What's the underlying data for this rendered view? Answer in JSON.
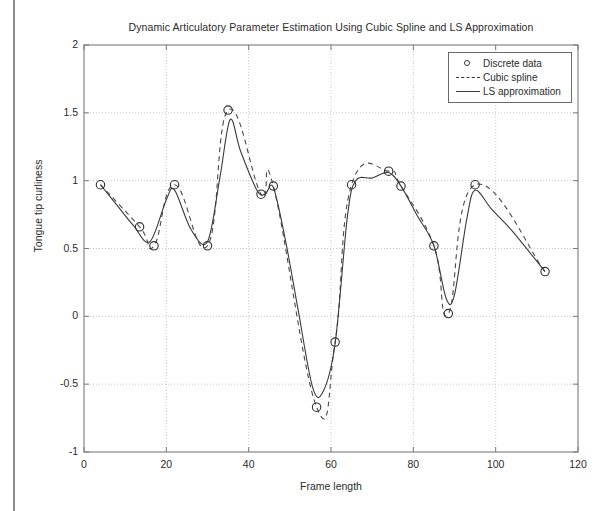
{
  "chart_data": {
    "type": "line",
    "title": "Dynamic Articulatory Parameter Estimation Using Cubic Spline and LS Approximation",
    "xlabel": "Frame length",
    "ylabel": "Tongue tip curliness",
    "xlim": [
      0,
      120
    ],
    "ylim": [
      -1,
      2
    ],
    "xticks": [
      0,
      20,
      40,
      60,
      80,
      100,
      120
    ],
    "yticks": [
      -1,
      -0.5,
      0,
      0.5,
      1,
      1.5,
      2
    ],
    "xtick_labels": [
      "0",
      "20",
      "40",
      "60",
      "80",
      "100",
      "120"
    ],
    "ytick_labels": [
      "-1",
      "-0.5",
      "0",
      "0.5",
      "1",
      "1.5",
      "2"
    ],
    "grid": true,
    "grid_style": "dotted",
    "legend_position": "top-right",
    "legend": [
      {
        "label": "Discrete data",
        "style": "circle-marker"
      },
      {
        "label": "Cubic spline",
        "style": "dashed-line"
      },
      {
        "label": "LS approximation",
        "style": "solid-line"
      }
    ],
    "series": [
      {
        "name": "Discrete data",
        "style": "markers",
        "x": [
          4,
          13.5,
          17,
          22,
          30,
          35,
          43,
          46,
          56.5,
          61,
          65,
          74,
          77,
          85,
          88.5,
          95,
          112
        ],
        "y": [
          0.97,
          0.66,
          0.52,
          0.97,
          0.52,
          1.52,
          0.9,
          0.96,
          -0.67,
          -0.19,
          0.97,
          1.07,
          0.96,
          0.52,
          0.02,
          0.97,
          0.33
        ]
      },
      {
        "name": "Cubic spline",
        "style": "dashed",
        "x": [
          4,
          13.5,
          17,
          22,
          30,
          35,
          43,
          46,
          56.5,
          61,
          65,
          74,
          77,
          85,
          88.5,
          95,
          112
        ],
        "y": [
          0.97,
          0.66,
          0.52,
          0.97,
          0.52,
          1.52,
          0.9,
          0.96,
          -0.67,
          -0.19,
          0.97,
          1.07,
          0.96,
          0.52,
          0.02,
          0.97,
          0.33
        ],
        "interpolation": "natural-cubic-spline",
        "overshoot_peaks": [
          {
            "x": 36.5,
            "y": 1.58
          },
          {
            "x": 69.5,
            "y": 1.34
          },
          {
            "x": 100,
            "y": 1.29
          }
        ]
      },
      {
        "name": "LS approximation",
        "style": "solid",
        "x": [
          4,
          8,
          12,
          16,
          20,
          22,
          26,
          30,
          33,
          35.5,
          38,
          42,
          44,
          46,
          49,
          52,
          55.5,
          58,
          61,
          64,
          66,
          70,
          74,
          77,
          81,
          85,
          88,
          90,
          93,
          95,
          99,
          104,
          112
        ],
        "y": [
          0.97,
          0.82,
          0.67,
          0.55,
          0.86,
          0.93,
          0.64,
          0.55,
          1.02,
          1.45,
          1.22,
          0.93,
          0.9,
          0.95,
          0.55,
          0.05,
          -0.52,
          -0.56,
          -0.2,
          0.74,
          1.0,
          1.02,
          1.06,
          0.96,
          0.74,
          0.52,
          0.13,
          0.16,
          0.72,
          0.93,
          0.79,
          0.63,
          0.33
        ]
      }
    ]
  },
  "plot_area": {
    "left": 84,
    "top": 45,
    "width": 494,
    "height": 407
  }
}
